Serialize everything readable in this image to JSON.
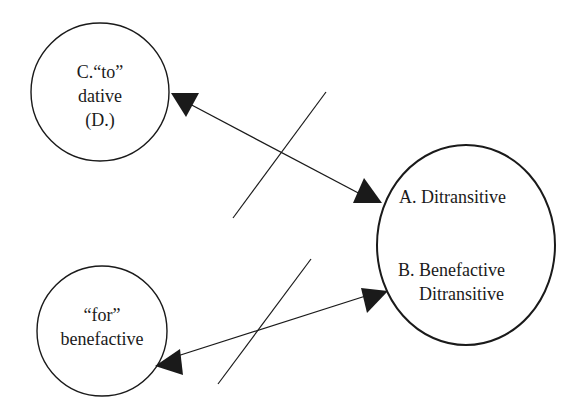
{
  "diagram": {
    "nodes": [
      {
        "id": "C",
        "lines": [
          "C.“to”",
          "dative",
          "(D.)"
        ]
      },
      {
        "id": "for",
        "lines": [
          "“for”",
          "benefactive"
        ]
      },
      {
        "id": "AB",
        "lines": [
          "A. Ditransitive",
          "B. Benefactive",
          "Ditransitive"
        ]
      }
    ],
    "edges": [
      {
        "from": "C",
        "to": "AB",
        "type": "bidirectional",
        "crossed": true
      },
      {
        "from": "for",
        "to": "AB",
        "type": "bidirectional",
        "crossed": true
      }
    ],
    "colors": {
      "stroke": "#1a1a1a",
      "background": "#ffffff"
    }
  }
}
